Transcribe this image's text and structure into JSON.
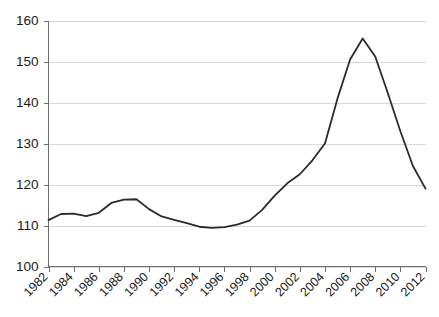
{
  "chart_data": {
    "type": "line",
    "title": "",
    "subtitle": "",
    "xlabel": "",
    "ylabel": "",
    "xlim": [
      1982,
      2012
    ],
    "ylim": [
      100,
      160
    ],
    "ytick_values": [
      100,
      110,
      120,
      130,
      140,
      150,
      160
    ],
    "ytick_labels": [
      "100",
      "110",
      "120",
      "130",
      "140",
      "150",
      "160"
    ],
    "xtick_values": [
      1982,
      1984,
      1986,
      1988,
      1990,
      1992,
      1994,
      1996,
      1998,
      2000,
      2002,
      2004,
      2006,
      2008,
      2010,
      2012
    ],
    "xtick_labels": [
      "1982",
      "1984",
      "1986",
      "1988",
      "1990",
      "1992",
      "1994",
      "1996",
      "1998",
      "2000",
      "2002",
      "2004",
      "2006",
      "2008",
      "2010",
      "2012"
    ],
    "xtick_label_rotation": -45,
    "grid": "horizontal",
    "legend": "none",
    "line_color": "#2b2b2b",
    "grid_color": "#d9d9d9",
    "axis_color": "#6e6e6e",
    "background_color": "#ffffff",
    "x": [
      1982,
      1983,
      1984,
      1985,
      1986,
      1987,
      1988,
      1989,
      1990,
      1991,
      1992,
      1993,
      1994,
      1995,
      1996,
      1997,
      1998,
      1999,
      2000,
      2001,
      2002,
      2003,
      2004,
      2005,
      2006,
      2007,
      2008,
      2009,
      2010,
      2011,
      2012
    ],
    "values": [
      111.3,
      112.8,
      112.9,
      112.3,
      113.1,
      115.5,
      116.3,
      116.4,
      114.0,
      112.2,
      111.4,
      110.6,
      109.7,
      109.4,
      109.6,
      110.2,
      111.2,
      113.8,
      117.3,
      120.3,
      122.5,
      125.9,
      130.0,
      141.0,
      150.5,
      155.6,
      151.2,
      142.3,
      133.0,
      124.5,
      119.0
    ],
    "series_name": "Index",
    "annotations": []
  }
}
